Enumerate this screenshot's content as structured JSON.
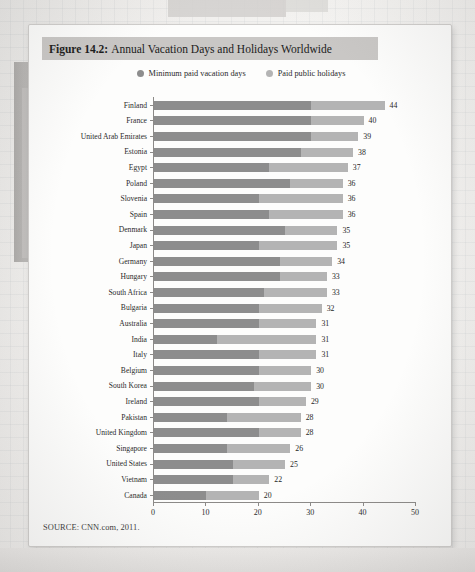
{
  "figure": {
    "number_label": "Figure 14.2:",
    "title": "Annual Vacation Days and Holidays Worldwide",
    "source_note": "SOURCE: CNN.com, 2011."
  },
  "legend": {
    "items": [
      {
        "label": "Minimum paid vacation days",
        "color": "#8d8d8d",
        "swatch_icon": "circle-swatch-icon"
      },
      {
        "label": "Paid public holidays",
        "color": "#b4b4b4",
        "swatch_icon": "circle-swatch-icon"
      }
    ]
  },
  "axis": {
    "x_ticks": [
      "0",
      "10",
      "20",
      "30",
      "40",
      "50"
    ]
  },
  "chart_data": {
    "type": "bar",
    "orientation": "horizontal",
    "stacked": true,
    "title": "Figure 14.2: Annual Vacation Days and Holidays Worldwide",
    "subtitle": "",
    "xlabel": "",
    "ylabel": "",
    "xlim": [
      0,
      50
    ],
    "x_ticks": [
      0,
      10,
      20,
      30,
      40,
      50
    ],
    "grid": false,
    "legend_position": "top-center",
    "source": "CNN.com, 2011.",
    "categories": [
      "Finland",
      "France",
      "United Arab Emirates",
      "Estonia",
      "Egypt",
      "Poland",
      "Slovenia",
      "Spain",
      "Denmark",
      "Japan",
      "Germany",
      "Hungary",
      "South Africa",
      "Bulgaria",
      "Australia",
      "India",
      "Italy",
      "Belgium",
      "South Korea",
      "Ireland",
      "Pakistan",
      "United Kingdom",
      "Singapore",
      "United States",
      "Vietnam",
      "Canada"
    ],
    "series": [
      {
        "name": "Minimum paid vacation days",
        "color": "#8d8d8d",
        "values": [
          30,
          30,
          30,
          28,
          22,
          26,
          20,
          22,
          25,
          20,
          24,
          24,
          21,
          20,
          20,
          12,
          20,
          20,
          19,
          20,
          14,
          20,
          14,
          15,
          15,
          10
        ]
      },
      {
        "name": "Paid public holidays",
        "color": "#b4b4b4",
        "values": [
          14,
          10,
          9,
          10,
          15,
          10,
          16,
          14,
          10,
          15,
          10,
          9,
          12,
          12,
          11,
          19,
          11,
          10,
          11,
          9,
          14,
          8,
          12,
          10,
          7,
          10
        ]
      }
    ],
    "totals": [
      44,
      40,
      39,
      38,
      37,
      36,
      36,
      36,
      35,
      35,
      34,
      33,
      33,
      32,
      31,
      31,
      31,
      30,
      30,
      29,
      28,
      28,
      26,
      25,
      22,
      20
    ],
    "total_labels": [
      "44",
      "40",
      "39",
      "38",
      "37",
      "36",
      "36",
      "36",
      "35",
      "35",
      "34",
      "33",
      "33",
      "32",
      "31",
      "31",
      "31",
      "30",
      "30",
      "29",
      "28",
      "28",
      "26",
      "25",
      "22",
      "20"
    ]
  }
}
